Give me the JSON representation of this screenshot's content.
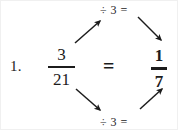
{
  "problem": {
    "number": "1.",
    "left_fraction": {
      "numerator": "3",
      "denominator": "21"
    },
    "relation": "=",
    "right_fraction": {
      "numerator": "1",
      "denominator": "7",
      "emphasis": "bold"
    }
  },
  "annotations": {
    "top_operation": "÷ 3 =",
    "bottom_operation": "÷ 3 ="
  },
  "arrows": [
    {
      "name": "arrow-upper-left",
      "description": "from numerator of 3/21 up-right to top operation label",
      "direction": "up-right"
    },
    {
      "name": "arrow-upper-right",
      "description": "from top operation label down-right to numerator of 1/7",
      "direction": "down-right"
    },
    {
      "name": "arrow-lower-left",
      "description": "from denominator of 3/21 down-right to bottom operation label",
      "direction": "down-right"
    },
    {
      "name": "arrow-lower-right",
      "description": "from bottom operation label up-right to denominator of 1/7",
      "direction": "up-right"
    }
  ],
  "colors": {
    "ink": "#1c1c1c",
    "background": "#ffffff",
    "border": "#f0f0f0"
  }
}
